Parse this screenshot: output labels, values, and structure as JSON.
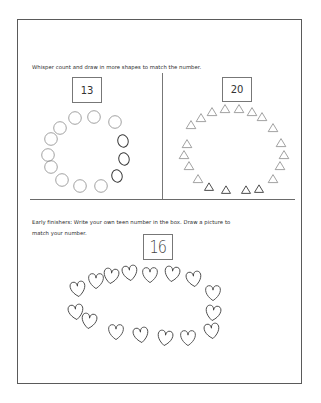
{
  "worksheet": {
    "instruction": "Whisper count and draw in more shapes to match the number.",
    "left_panel": {
      "number": "13",
      "shape": "circle",
      "printed_circles": [
        [
          75,
          118
        ],
        [
          94,
          117
        ],
        [
          115,
          122
        ],
        [
          60,
          128
        ],
        [
          51,
          139
        ],
        [
          48,
          155
        ],
        [
          51,
          167
        ],
        [
          62,
          180
        ],
        [
          80,
          186
        ],
        [
          101,
          186
        ]
      ],
      "drawn_circles": [
        [
          123,
          141
        ],
        [
          124,
          159
        ],
        [
          117,
          176
        ]
      ]
    },
    "right_panel": {
      "number": "20",
      "shape": "triangle",
      "printed_triangles": [
        [
          212,
          112
        ],
        [
          225,
          109
        ],
        [
          239,
          109
        ],
        [
          252,
          112
        ],
        [
          201,
          118
        ],
        [
          191,
          125
        ],
        [
          187,
          144
        ],
        [
          184,
          155
        ],
        [
          189,
          166
        ],
        [
          198,
          179
        ],
        [
          262,
          117
        ],
        [
          273,
          128
        ],
        [
          281,
          143
        ],
        [
          284,
          155
        ],
        [
          280,
          166
        ],
        [
          273,
          179
        ]
      ],
      "drawn_triangles": [
        [
          209,
          187
        ],
        [
          226,
          190
        ],
        [
          246,
          190
        ],
        [
          259,
          189
        ]
      ]
    },
    "early_finishers": {
      "line1": "Early finishers:  Write your own teen number in the box.  Draw a picture to",
      "line2": "match your number.",
      "number": "16",
      "shape": "heart",
      "hearts": [
        [
          78,
          290
        ],
        [
          96,
          282
        ],
        [
          111,
          277
        ],
        [
          130,
          274
        ],
        [
          150,
          276
        ],
        [
          172,
          275
        ],
        [
          194,
          280
        ],
        [
          213,
          294
        ],
        [
          213,
          314
        ],
        [
          212,
          332
        ],
        [
          188,
          339
        ],
        [
          165,
          339
        ],
        [
          141,
          336
        ],
        [
          116,
          333
        ],
        [
          89,
          322
        ],
        [
          76,
          313
        ]
      ]
    },
    "colors": {
      "border": "#5a5a5a",
      "printed_stroke": "#8a8a8a",
      "drawn_stroke": "#3a3a3a",
      "text": "#2a2a2a"
    }
  }
}
